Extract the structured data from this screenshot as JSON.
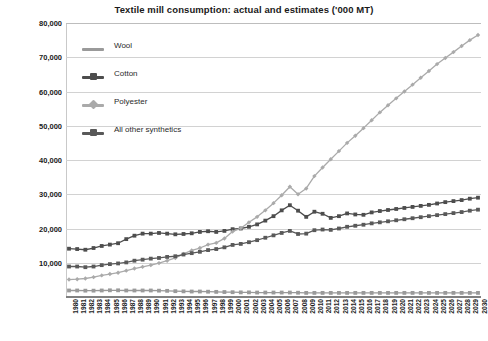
{
  "chart_data": {
    "type": "line",
    "title": "Textile mill consumption: actual and estimates ('000 MT)",
    "xlabel": "",
    "ylabel": "",
    "ylim": [
      0,
      80000
    ],
    "ytick_step": 10000,
    "ytick_labels": [
      "80,000",
      "70,000",
      "60,000",
      "50,000",
      "40,000",
      "30,000",
      "20,000",
      "10,000"
    ],
    "ytick_values": [
      80000,
      70000,
      60000,
      50000,
      40000,
      30000,
      20000,
      10000
    ],
    "grid": true,
    "legend_position": "upper-left-inside",
    "x": [
      1980,
      1981,
      1982,
      1983,
      1984,
      1985,
      1986,
      1987,
      1988,
      1989,
      1990,
      1991,
      1992,
      1993,
      1994,
      1995,
      1996,
      1997,
      1998,
      1999,
      2000,
      2001,
      2002,
      2003,
      2004,
      2005,
      2006,
      2007,
      2008,
      2009,
      2010,
      2011,
      2012,
      2013,
      2014,
      2015,
      2016,
      2017,
      2018,
      2019,
      2020,
      2021,
      2022,
      2023,
      2024,
      2025,
      2026,
      2027,
      2028,
      2029,
      2030
    ],
    "categories": [
      "1980",
      "1981",
      "1982",
      "1983",
      "1984",
      "1985",
      "1986",
      "1987",
      "1988",
      "1989",
      "1990",
      "1991",
      "1992",
      "1993",
      "1994",
      "1995",
      "1996",
      "1997",
      "1998",
      "1999",
      "2000",
      "2001",
      "2002",
      "2003",
      "2004",
      "2005",
      "2006",
      "2007",
      "2008",
      "2009",
      "2010",
      "2011",
      "2012",
      "2013",
      "2014",
      "2015",
      "2016",
      "2017",
      "2018",
      "2019",
      "2020",
      "2021",
      "2022",
      "2023",
      "2024",
      "2025",
      "2026",
      "2027",
      "2028",
      "2029",
      "2030"
    ],
    "series": [
      {
        "name": "Wool",
        "color": "#9a9a9a",
        "marker": "square",
        "values": [
          1900,
          1900,
          1850,
          1850,
          1900,
          1950,
          1950,
          1900,
          1900,
          1900,
          1900,
          1850,
          1800,
          1700,
          1650,
          1600,
          1600,
          1550,
          1500,
          1450,
          1400,
          1350,
          1350,
          1300,
          1300,
          1300,
          1300,
          1300,
          1250,
          1200,
          1200,
          1200,
          1200,
          1200,
          1200,
          1200,
          1200,
          1200,
          1200,
          1200,
          1200,
          1200,
          1200,
          1200,
          1200,
          1200,
          1200,
          1200,
          1200,
          1200,
          1200
        ]
      },
      {
        "name": "Cotton",
        "color": "#4d4d4d",
        "marker": "square",
        "values": [
          14100,
          14000,
          13800,
          14300,
          14900,
          15300,
          15700,
          16900,
          17900,
          18500,
          18500,
          18700,
          18500,
          18300,
          18400,
          18600,
          19000,
          19200,
          19000,
          19300,
          19800,
          20000,
          20500,
          21200,
          22300,
          23600,
          25300,
          26800,
          25200,
          23400,
          24900,
          24300,
          23100,
          23600,
          24400,
          24100,
          24000,
          24700,
          25100,
          25400,
          25700,
          26000,
          26300,
          26600,
          26900,
          27300,
          27700,
          28000,
          28300,
          28700,
          29000
        ]
      },
      {
        "name": "Polyester",
        "color": "#aaaaaa",
        "marker": "diamond",
        "values": [
          5100,
          5200,
          5400,
          5800,
          6300,
          6700,
          7100,
          7700,
          8300,
          8800,
          9300,
          9900,
          10600,
          11400,
          12600,
          13600,
          14300,
          15300,
          15800,
          17100,
          19100,
          20100,
          21800,
          23400,
          25300,
          27400,
          29700,
          32200,
          30000,
          31700,
          35300,
          37800,
          40200,
          42600,
          45000,
          47100,
          49300,
          51600,
          53900,
          56000,
          58000,
          60000,
          62000,
          64000,
          66000,
          68000,
          69800,
          71500,
          73300,
          75000,
          76500
        ]
      },
      {
        "name": "All other synthetics",
        "color": "#595959",
        "marker": "square",
        "values": [
          8900,
          8900,
          8700,
          8900,
          9300,
          9600,
          9800,
          10100,
          10600,
          10900,
          11200,
          11400,
          11700,
          11900,
          12400,
          12800,
          13200,
          13700,
          14000,
          14500,
          15200,
          15500,
          16000,
          16600,
          17300,
          18000,
          18700,
          19300,
          18400,
          18500,
          19500,
          19700,
          19600,
          20000,
          20500,
          20800,
          21100,
          21500,
          21800,
          22100,
          22400,
          22700,
          23000,
          23300,
          23600,
          23900,
          24200,
          24500,
          24800,
          25200,
          25500
        ]
      }
    ]
  },
  "legend": {
    "items": [
      {
        "label": "Wool"
      },
      {
        "label": "Cotton"
      },
      {
        "label": "Polyester"
      },
      {
        "label": "All other synthetics"
      }
    ]
  }
}
